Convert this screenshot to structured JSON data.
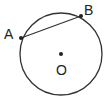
{
  "diagram": {
    "type": "circle-chord",
    "circle": {
      "cx": 61,
      "cy": 54,
      "r": 41,
      "stroke": "#333333"
    },
    "points": [
      {
        "label": "A",
        "x": 21,
        "y": 38,
        "label_x": 4,
        "label_y": 39
      },
      {
        "label": "B",
        "x": 81,
        "y": 16,
        "label_x": 84,
        "label_y": 15
      },
      {
        "label": "O",
        "x": 61,
        "y": 54,
        "label_x": 56,
        "label_y": 75
      }
    ],
    "chord": {
      "from": "A",
      "to": "B"
    }
  }
}
